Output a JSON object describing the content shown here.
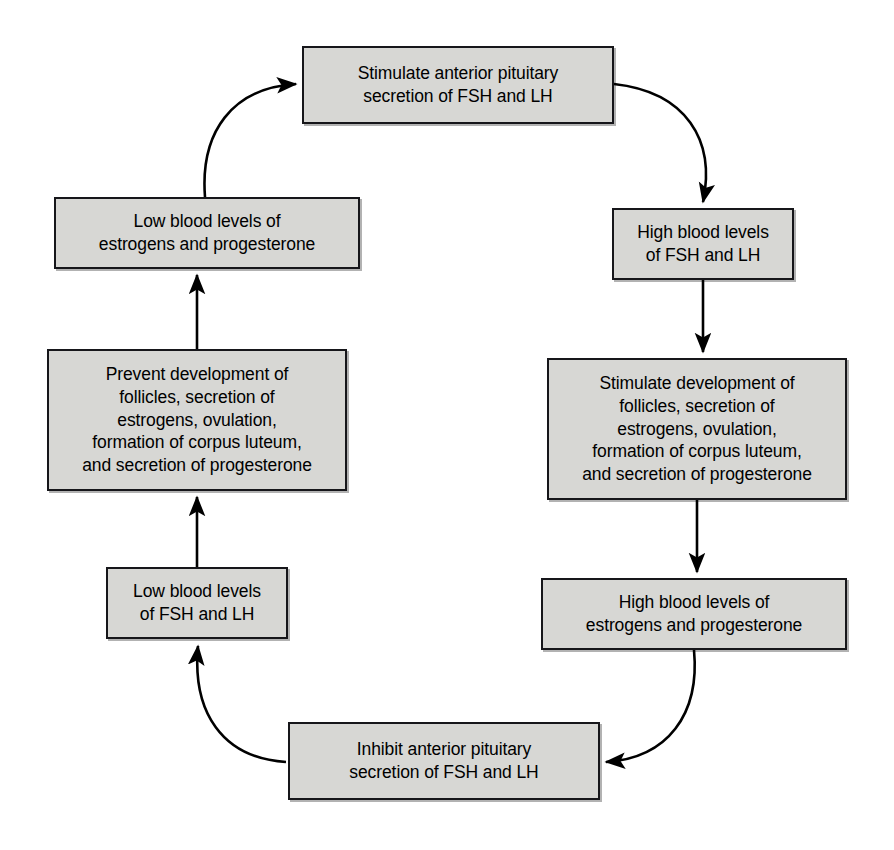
{
  "diagram": {
    "canvas": {
      "width": 894,
      "height": 850
    },
    "style": {
      "box_fill": "#d7d7d4",
      "box_border": "#16161a",
      "text_color": "#000000",
      "background": "#ffffff",
      "arrow_color": "#000000"
    },
    "nodes": [
      {
        "id": "stimulate-anterior-pituitary",
        "label": "Stimulate anterior pituitary\nsecretion of FSH and LH",
        "x": 302,
        "y": 46,
        "w": 312,
        "h": 78
      },
      {
        "id": "high-fsh-lh",
        "label": "High blood levels\nof FSH and LH",
        "x": 612,
        "y": 208,
        "w": 182,
        "h": 72
      },
      {
        "id": "stimulate-development",
        "label": "Stimulate development of\nfollicles, secretion of\nestrogens, ovulation,\nformation of corpus luteum,\nand secretion of progesterone",
        "x": 547,
        "y": 358,
        "w": 300,
        "h": 142
      },
      {
        "id": "high-estrogens-progesterone",
        "label": "High blood levels of\nestrogens and progesterone",
        "x": 541,
        "y": 578,
        "w": 306,
        "h": 72
      },
      {
        "id": "inhibit-anterior-pituitary",
        "label": "Inhibit anterior pituitary\nsecretion of FSH and LH",
        "x": 288,
        "y": 722,
        "w": 312,
        "h": 78
      },
      {
        "id": "low-fsh-lh",
        "label": "Low blood levels\nof FSH and LH",
        "x": 106,
        "y": 567,
        "w": 182,
        "h": 72
      },
      {
        "id": "prevent-development",
        "label": "Prevent development of\nfollicles, secretion of\nestrogens, ovulation,\nformation of corpus luteum,\nand secretion of progesterone",
        "x": 47,
        "y": 349,
        "w": 300,
        "h": 142
      },
      {
        "id": "low-estrogens-progesterone",
        "label": "Low blood levels of\nestrogens and progesterone",
        "x": 54,
        "y": 197,
        "w": 306,
        "h": 72
      }
    ],
    "edges": [
      {
        "id": "edge-top-to-high-fsh",
        "from": "stimulate-anterior-pituitary",
        "to": "high-fsh-lh",
        "kind": "curve",
        "path": "M 614 84 C 686 92 716 140 703 202"
      },
      {
        "id": "edge-high-fsh-to-stimulate-dev",
        "from": "high-fsh-lh",
        "to": "stimulate-development",
        "kind": "straight",
        "path": "M 703 280 L 703 352"
      },
      {
        "id": "edge-stimulate-dev-to-high-estro",
        "from": "stimulate-development",
        "to": "high-estrogens-progesterone",
        "kind": "straight",
        "path": "M 697 500 L 697 572"
      },
      {
        "id": "edge-high-estro-to-inhibit",
        "from": "high-estrogens-progesterone",
        "to": "inhibit-anterior-pituitary",
        "kind": "curve",
        "path": "M 694 650 C 700 714 668 758 606 762"
      },
      {
        "id": "edge-inhibit-to-low-fsh",
        "from": "inhibit-anterior-pituitary",
        "to": "low-fsh-lh",
        "kind": "curve",
        "path": "M 286 762 C 222 758 192 712 198 646"
      },
      {
        "id": "edge-low-fsh-to-prevent",
        "from": "low-fsh-lh",
        "to": "prevent-development",
        "kind": "straight",
        "path": "M 197 567 L 197 497"
      },
      {
        "id": "edge-prevent-to-low-estro",
        "from": "prevent-development",
        "to": "low-estrogens-progesterone",
        "kind": "straight",
        "path": "M 197 349 L 197 275"
      },
      {
        "id": "edge-low-estro-to-top",
        "from": "low-estrogens-progesterone",
        "to": "stimulate-anterior-pituitary",
        "kind": "curve",
        "path": "M 205 197 C 200 132 232 88 296 84"
      }
    ]
  }
}
